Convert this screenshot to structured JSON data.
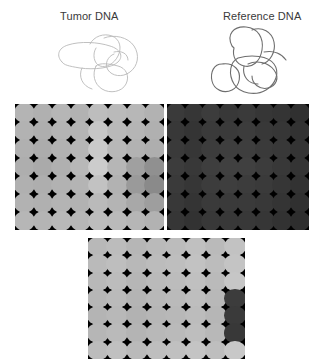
{
  "figure": {
    "background_color": "#ffffff",
    "width": 321,
    "height": 359
  },
  "labels": {
    "tumor": "Tumor DNA",
    "reference": "Reference DNA",
    "text_color": "#3a3a3a"
  },
  "dna_drawings": [
    {
      "name": "tumor-dna-squiggle",
      "stroke_color": "#b9b9b9",
      "stroke_width": 0.9,
      "width": 92,
      "height": 64,
      "paths": [
        "M10 30 C4 24, 6 16, 16 13 C28 9, 46 10, 58 14 C68 17, 72 24, 66 30 C60 36, 42 38, 28 36 C16 34, 12 33, 10 30 Z",
        "M38 12 C42 4, 52 1, 60 4 C68 7, 70 16, 66 24 C62 32, 54 36, 48 34 C42 32, 40 22, 44 16",
        "M52 6 C62 2, 76 5, 82 14 C88 23, 86 34, 78 40 C70 46, 60 44, 56 38 C52 32, 56 24, 62 22",
        "M44 34 C40 42, 42 52, 50 57 C58 62, 70 60, 74 52 C78 44, 74 36, 66 34 C58 32, 48 30, 44 34 Z",
        "M30 36 C26 44, 30 54, 40 57",
        "M62 20 C70 18, 76 22, 76 28"
      ]
    },
    {
      "name": "reference-dna-squiggle",
      "stroke_color": "#6e6e6e",
      "stroke_width": 1.1,
      "width": 86,
      "height": 72,
      "paths": [
        "M24 22 C18 10, 26 2, 38 3 C50 4, 56 14, 54 26 C52 38, 44 44, 36 42 C28 40, 24 32, 26 24 Z",
        "M14 40 C6 40, 2 48, 4 57 C6 66, 16 70, 24 66 C32 62, 34 50, 28 44 C22 38, 16 40, 14 40 Z",
        "M30 34 C22 38, 20 50, 26 60 C32 70, 48 72, 58 66 C68 60, 72 48, 66 40 C60 32, 44 30, 30 34 Z",
        "M40 40 C48 36, 60 38, 66 46 C72 54, 68 62, 60 64 C52 66, 44 60, 44 52",
        "M44 6 C54 2, 64 8, 66 18 C68 28, 62 38, 54 40",
        "M56 28 C66 26, 74 30, 78 36",
        "M36 42 C34 52, 40 60, 50 60"
      ]
    }
  ],
  "arrays": [
    {
      "name": "tumor-array-panel",
      "columns": 8,
      "rows": 7,
      "background_color": "#000000",
      "spot_colors": [
        [
          "#b4b4b4",
          "#b0b0b0",
          "#b6b6b6",
          "#b2b2b2",
          "#bdbdbd",
          "#bababa",
          "#b7b7b7",
          "#b2b2b2"
        ],
        [
          "#b2b2b2",
          "#aeaeae",
          "#b4b4b4",
          "#b4b4b4",
          "#c6c6c6",
          "#b9b9b9",
          "#b5b5b5",
          "#b0b0b0"
        ],
        [
          "#b0b0b0",
          "#acacac",
          "#b2b2b2",
          "#b6b6b6",
          "#cacaca",
          "#b8b8b8",
          "#b2b2b2",
          "#aeaeae"
        ],
        [
          "#aeaeae",
          "#aaaaaa",
          "#b0b0b0",
          "#b8b8b8",
          "#cccccc",
          "#b6b6b6",
          "#a0a0a0",
          "#909090"
        ],
        [
          "#b0b0b0",
          "#aeaeae",
          "#b2b2b2",
          "#b4b4b4",
          "#c2c2c2",
          "#b2b2b2",
          "#9a9a9a",
          "#8a8a8a"
        ],
        [
          "#b2b2b2",
          "#b0b0b0",
          "#b4b4b4",
          "#b2b2b2",
          "#bababa",
          "#b4b4b4",
          "#a8a8a8",
          "#9e9e9e"
        ],
        [
          "#b6b6b6",
          "#b4b4b4",
          "#b8b8b8",
          "#b6b6b6",
          "#bcbcbc",
          "#bababa",
          "#b6b6b6",
          "#b2b2b2"
        ]
      ]
    },
    {
      "name": "reference-array-panel",
      "columns": 8,
      "rows": 7,
      "background_color": "#000000",
      "spot_colors": [
        [
          "#3a3a3a",
          "#363636",
          "#3c3c3c",
          "#383838",
          "#3a3a3a",
          "#363636",
          "#343434",
          "#303030"
        ],
        [
          "#383838",
          "#343434",
          "#3a3a3a",
          "#3a3a3a",
          "#3c3c3c",
          "#383838",
          "#363636",
          "#323232"
        ],
        [
          "#3a3a3a",
          "#363636",
          "#3c3c3c",
          "#3e3e3e",
          "#3e3e3e",
          "#3a3a3a",
          "#383838",
          "#343434"
        ],
        [
          "#3c3c3c",
          "#383838",
          "#3e3e3e",
          "#404040",
          "#404040",
          "#3c3c3c",
          "#383838",
          "#343434"
        ],
        [
          "#3a3a3a",
          "#363636",
          "#3c3c3c",
          "#3e3e3e",
          "#3c3c3c",
          "#3a3a3a",
          "#363636",
          "#323232"
        ],
        [
          "#383838",
          "#343434",
          "#3a3a3a",
          "#3a3a3a",
          "#3a3a3a",
          "#383838",
          "#343434",
          "#303030"
        ],
        [
          "#363636",
          "#323232",
          "#383838",
          "#383838",
          "#383838",
          "#363636",
          "#323232",
          "#2e2e2e"
        ]
      ]
    },
    {
      "name": "merged-array-panel",
      "columns": 8,
      "rows": 7,
      "background_color": "#000000",
      "spot_colors": [
        [
          "#b8b8b8",
          "#bcbcbc",
          "#b6b6b6",
          "#babab a",
          "#bcbcbc",
          "#c0c0c0",
          "#bababa",
          "#c2c2c2"
        ],
        [
          "#bababa",
          "#bebebe",
          "#b8b8b8",
          "#bcbcbc",
          "#bebebe",
          "#c2c2c2",
          "#bcbcbc",
          "#c4c4c4"
        ],
        [
          "#b8b8b8",
          "#bcbcbc",
          "#b6b6b6",
          "#bababa",
          "#bcbcbc",
          "#c0c0c0",
          "#babab a",
          "#c6c6c6"
        ],
        [
          "#b6b6b6",
          "#bababa",
          "#b4b4b4",
          "#b8b8b8",
          "#bababa",
          "#bebebe",
          "#b8b8b8",
          "#3c3c3c"
        ],
        [
          "#b4b4b4",
          "#b8b8b8",
          "#b2b2b2",
          "#b6b6b6",
          "#b8b8b8",
          "#bcbcbc",
          "#b6b6b6",
          "#3a3a3a"
        ],
        [
          "#b6b6b6",
          "#bababa",
          "#b4b4b4",
          "#b8b8b8",
          "#bababa",
          "#bebebe",
          "#b8b8b8",
          "#383838"
        ],
        [
          "#bcbcbc",
          "#c0c0c0",
          "#bababa",
          "#bebebe",
          "#c0c0c0",
          "#c4c4c4",
          "#bebebe",
          "#c8c8c8"
        ]
      ]
    }
  ]
}
